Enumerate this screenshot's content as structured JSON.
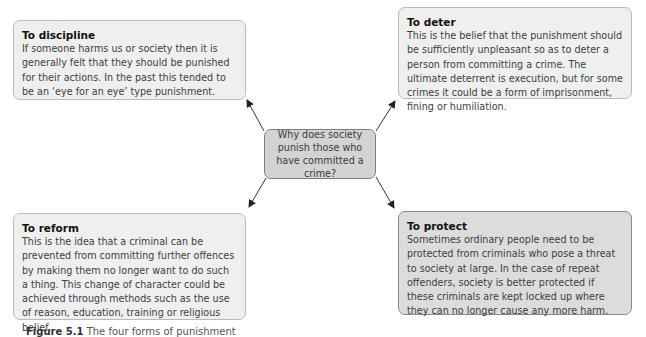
{
  "center": {
    "text": "Why does society punish those who have committed a crime?"
  },
  "boxes": [
    {
      "id": "discipline",
      "title": "To discipline",
      "body": "If someone harms us or society then it is generally felt that they should be punished for their actions. In the past this tended to be an ‘eye for an eye’ type punishment."
    },
    {
      "id": "deter",
      "title": "To deter",
      "body": "This is the belief that the punishment should be sufficiently unpleasant so as to deter a person from committing a crime. The ultimate deterrent is execution, but for some crimes it could be a form of imprisonment, fining or humiliation."
    },
    {
      "id": "reform",
      "title": "To reform",
      "body": "This is the idea that a criminal can be prevented from committing further offences by making them no longer want to do such a thing. This change of character could be achieved through methods such as the use of reason, education, training or religious belief."
    },
    {
      "id": "protect",
      "title": "To protect",
      "body": "Sometimes ordinary people need to be protected from criminals who pose a threat to society at large. In the case of repeat offenders, society is better protected if these criminals are kept locked up where they can no longer cause any more harm."
    }
  ],
  "caption": {
    "label": "Figure 5.1",
    "text": "The four forms of punishment"
  }
}
